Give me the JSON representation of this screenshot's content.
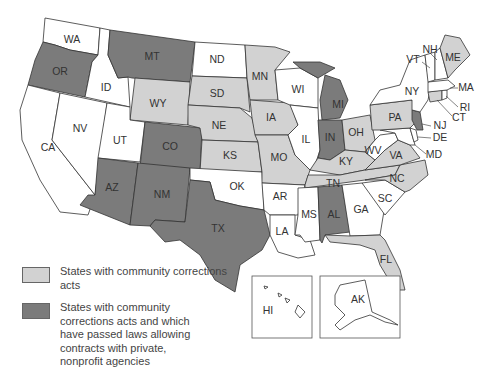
{
  "map": {
    "colors": {
      "none": "#ffffff",
      "light": "#d2d2d2",
      "dark": "#7b7b7b",
      "border": "#333333"
    },
    "states": [
      {
        "abbr": "WA",
        "category": "none"
      },
      {
        "abbr": "OR",
        "category": "dark"
      },
      {
        "abbr": "CA",
        "category": "none"
      },
      {
        "abbr": "ID",
        "category": "none"
      },
      {
        "abbr": "NV",
        "category": "none"
      },
      {
        "abbr": "MT",
        "category": "dark"
      },
      {
        "abbr": "WY",
        "category": "light"
      },
      {
        "abbr": "UT",
        "category": "none"
      },
      {
        "abbr": "CO",
        "category": "dark"
      },
      {
        "abbr": "AZ",
        "category": "dark"
      },
      {
        "abbr": "NM",
        "category": "dark"
      },
      {
        "abbr": "ND",
        "category": "none"
      },
      {
        "abbr": "SD",
        "category": "light"
      },
      {
        "abbr": "NE",
        "category": "light"
      },
      {
        "abbr": "KS",
        "category": "light"
      },
      {
        "abbr": "OK",
        "category": "none"
      },
      {
        "abbr": "TX",
        "category": "dark"
      },
      {
        "abbr": "MN",
        "category": "light"
      },
      {
        "abbr": "IA",
        "category": "light"
      },
      {
        "abbr": "MO",
        "category": "light"
      },
      {
        "abbr": "AR",
        "category": "none"
      },
      {
        "abbr": "LA",
        "category": "none"
      },
      {
        "abbr": "WI",
        "category": "none"
      },
      {
        "abbr": "IL",
        "category": "none"
      },
      {
        "abbr": "MI",
        "category": "dark"
      },
      {
        "abbr": "IN",
        "category": "dark"
      },
      {
        "abbr": "OH",
        "category": "light"
      },
      {
        "abbr": "KY",
        "category": "light"
      },
      {
        "abbr": "TN",
        "category": "light"
      },
      {
        "abbr": "MS",
        "category": "none"
      },
      {
        "abbr": "AL",
        "category": "dark"
      },
      {
        "abbr": "GA",
        "category": "none"
      },
      {
        "abbr": "FL",
        "category": "light"
      },
      {
        "abbr": "SC",
        "category": "none"
      },
      {
        "abbr": "NC",
        "category": "light"
      },
      {
        "abbr": "VA",
        "category": "light"
      },
      {
        "abbr": "WV",
        "category": "none"
      },
      {
        "abbr": "MD",
        "category": "none"
      },
      {
        "abbr": "DE",
        "category": "none"
      },
      {
        "abbr": "PA",
        "category": "light"
      },
      {
        "abbr": "NJ",
        "category": "dark"
      },
      {
        "abbr": "NY",
        "category": "none"
      },
      {
        "abbr": "CT",
        "category": "light"
      },
      {
        "abbr": "RI",
        "category": "none"
      },
      {
        "abbr": "MA",
        "category": "none"
      },
      {
        "abbr": "VT",
        "category": "none"
      },
      {
        "abbr": "NH",
        "category": "none"
      },
      {
        "abbr": "ME",
        "category": "light"
      },
      {
        "abbr": "HI",
        "category": "none"
      },
      {
        "abbr": "AK",
        "category": "none"
      }
    ]
  },
  "labels": {
    "WA": "WA",
    "OR": "OR",
    "CA": "CA",
    "ID": "ID",
    "NV": "NV",
    "MT": "MT",
    "WY": "WY",
    "UT": "UT",
    "CO": "CO",
    "AZ": "AZ",
    "NM": "NM",
    "ND": "ND",
    "SD": "SD",
    "NE": "NE",
    "KS": "KS",
    "OK": "OK",
    "TX": "TX",
    "MN": "MN",
    "IA": "IA",
    "MO": "MO",
    "AR": "AR",
    "LA": "LA",
    "WI": "WI",
    "IL": "IL",
    "MI": "MI",
    "IN": "IN",
    "OH": "OH",
    "KY": "KY",
    "TN": "TN",
    "MS": "MS",
    "AL": "AL",
    "GA": "GA",
    "FL": "FL",
    "SC": "SC",
    "NC": "NC",
    "VA": "VA",
    "WV": "WV",
    "MD": "MD",
    "DE": "DE",
    "PA": "PA",
    "NJ": "NJ",
    "NY": "NY",
    "CT": "CT",
    "RI": "RI",
    "MA": "MA",
    "VT": "VT",
    "NH": "NH",
    "ME": "ME",
    "HI": "HI",
    "AK": "AK"
  },
  "legend": {
    "items": [
      {
        "category": "light",
        "label": "States with community corrections acts"
      },
      {
        "category": "dark",
        "label": "States with community corrections acts and which have passed laws allowing contracts with private, nonprofit agencies"
      }
    ]
  }
}
